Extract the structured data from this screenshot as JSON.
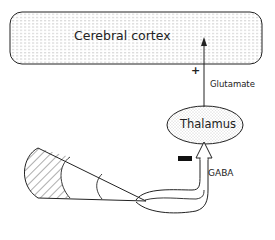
{
  "diagram": {
    "nodes": {
      "cortex": {
        "label": "Cerebral cortex"
      },
      "thalamus": {
        "label": "Thalamus"
      }
    },
    "edges": {
      "glutamate": {
        "label": "Glutamate",
        "sign": "+",
        "from": "Thalamus",
        "to": "Cerebral cortex"
      },
      "gaba": {
        "label": "GABA",
        "sign": "−",
        "from": "Basal ganglia",
        "to": "Thalamus"
      }
    },
    "colors": {
      "stroke": "#222222",
      "fill": "#ffffff",
      "stipple": "#9a9a9a"
    }
  }
}
